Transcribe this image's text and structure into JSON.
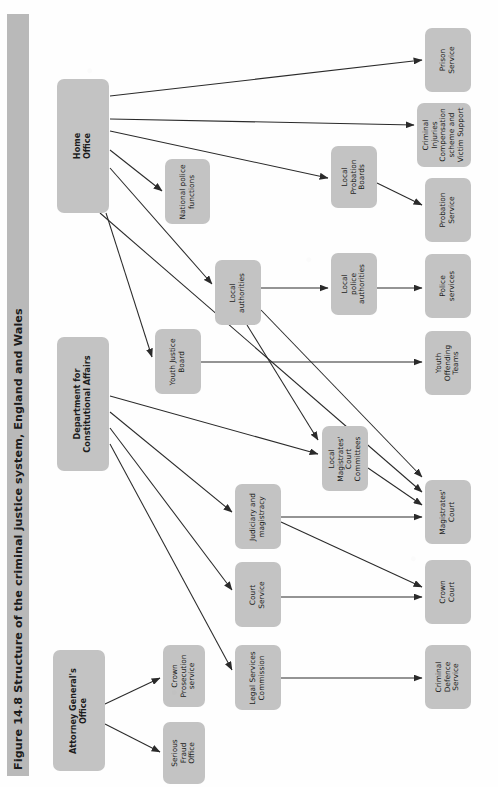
{
  "figure": {
    "title": "Figure 14.8 Structure of the criminal justice system, England and Wales",
    "orientation": "rotated-90-ccw",
    "box_fill": "#c3c3c3",
    "title_bar_fill": "#b9b9b9",
    "arrow_color": "#2a2a2a",
    "page_background": "#fefefe"
  },
  "nodes": [
    {
      "id": "home-office",
      "label": "Home\nOffice",
      "bold": true,
      "x": 57,
      "y": 79,
      "w": 52,
      "h": 134
    },
    {
      "id": "dept-constitutional",
      "label": "Department for\nConstitutional Affairs",
      "bold": true,
      "x": 57,
      "y": 337,
      "w": 52,
      "h": 134
    },
    {
      "id": "attorney-general",
      "label": "Attorney General's\nOffice",
      "bold": true,
      "x": 53,
      "y": 650,
      "w": 52,
      "h": 121
    },
    {
      "id": "national-police",
      "label": "National police\nfunctions",
      "bold": false,
      "x": 165,
      "y": 159,
      "w": 45,
      "h": 65
    },
    {
      "id": "local-authorities",
      "label": "Local\nauthorities",
      "bold": false,
      "x": 215,
      "y": 260,
      "w": 46,
      "h": 65
    },
    {
      "id": "youth-justice-board",
      "label": "Youth Justice\nBoard",
      "bold": false,
      "x": 155,
      "y": 329,
      "w": 46,
      "h": 65
    },
    {
      "id": "local-mag-committees",
      "label": "Local\nMagistrates'\nCourt\nCommittees",
      "bold": false,
      "x": 322,
      "y": 426,
      "w": 46,
      "h": 65
    },
    {
      "id": "judiciary-magistracy",
      "label": "Judiciary and\nmagistracy",
      "bold": false,
      "x": 235,
      "y": 484,
      "w": 46,
      "h": 65
    },
    {
      "id": "court-service",
      "label": "Court\nService",
      "bold": false,
      "x": 235,
      "y": 562,
      "w": 46,
      "h": 65
    },
    {
      "id": "legal-services-comm",
      "label": "Legal Services\nCommission",
      "bold": false,
      "x": 235,
      "y": 645,
      "w": 46,
      "h": 65
    },
    {
      "id": "crown-prosecution",
      "label": "Crown\nProsecution\nservice",
      "bold": false,
      "x": 163,
      "y": 645,
      "w": 42,
      "h": 62
    },
    {
      "id": "serious-fraud",
      "label": "Serious\nFraud\nOffice",
      "bold": false,
      "x": 163,
      "y": 722,
      "w": 42,
      "h": 62
    },
    {
      "id": "local-probation-boards",
      "label": "Local\nProbation\nBoards",
      "bold": false,
      "x": 331,
      "y": 146,
      "w": 46,
      "h": 62
    },
    {
      "id": "local-police-auth",
      "label": "Local\npolice\nauthorities",
      "bold": false,
      "x": 331,
      "y": 253,
      "w": 46,
      "h": 62
    },
    {
      "id": "prison-service",
      "label": "Prison\nService",
      "bold": false,
      "x": 425,
      "y": 28,
      "w": 46,
      "h": 64
    },
    {
      "id": "criminal-injuries",
      "label": "Criminal\nInjuries\nCompensation\nscheme and\nVictim Support",
      "bold": false,
      "x": 417,
      "y": 103,
      "w": 54,
      "h": 64
    },
    {
      "id": "probation-service",
      "label": "Probation\nService",
      "bold": false,
      "x": 425,
      "y": 178,
      "w": 46,
      "h": 64
    },
    {
      "id": "police-services",
      "label": "Police\nservices",
      "bold": false,
      "x": 425,
      "y": 254,
      "w": 46,
      "h": 64
    },
    {
      "id": "youth-offending-teams",
      "label": "Youth\nOffending\nTeams",
      "bold": false,
      "x": 425,
      "y": 331,
      "w": 46,
      "h": 64
    },
    {
      "id": "magistrates-court",
      "label": "Magistrates'\nCourt",
      "bold": false,
      "x": 425,
      "y": 480,
      "w": 46,
      "h": 64
    },
    {
      "id": "crown-court",
      "label": "Crown\nCourt",
      "bold": false,
      "x": 425,
      "y": 560,
      "w": 46,
      "h": 64
    },
    {
      "id": "criminal-defence",
      "label": "Criminal\nDefence\nService",
      "bold": false,
      "x": 425,
      "y": 645,
      "w": 46,
      "h": 64
    }
  ],
  "edges": [
    {
      "from": "home-office",
      "to": "prison-service",
      "x1": 110,
      "y1": 96,
      "x2": 422,
      "y2": 60
    },
    {
      "from": "home-office",
      "to": "criminal-injuries",
      "x1": 110,
      "y1": 119,
      "x2": 414,
      "y2": 125
    },
    {
      "from": "home-office",
      "to": "local-probation-boards",
      "x1": 110,
      "y1": 131,
      "x2": 328,
      "y2": 178
    },
    {
      "from": "home-office",
      "to": "national-police",
      "x1": 110,
      "y1": 150,
      "x2": 162,
      "y2": 191
    },
    {
      "from": "home-office",
      "to": "local-authorities",
      "x1": 110,
      "y1": 168,
      "x2": 212,
      "y2": 284
    },
    {
      "from": "home-office",
      "to": "youth-justice-board",
      "x1": 106,
      "y1": 213,
      "x2": 152,
      "y2": 357
    },
    {
      "from": "home-office",
      "to": "magistrates-court",
      "x1": 100,
      "y1": 213,
      "x2": 422,
      "y2": 492
    },
    {
      "from": "local-probation-boards",
      "to": "probation-service",
      "x1": 377,
      "y1": 183,
      "x2": 422,
      "y2": 205
    },
    {
      "from": "local-authorities",
      "to": "local-police-auth",
      "x1": 261,
      "y1": 288,
      "x2": 328,
      "y2": 288
    },
    {
      "from": "local-police-auth",
      "to": "police-services",
      "x1": 377,
      "y1": 288,
      "x2": 422,
      "y2": 288
    },
    {
      "from": "local-authorities",
      "to": "local-mag-committees",
      "x1": 247,
      "y1": 325,
      "x2": 318,
      "y2": 440
    },
    {
      "from": "local-authorities",
      "to": "magistrates-court",
      "x1": 261,
      "y1": 310,
      "x2": 422,
      "y2": 477
    },
    {
      "from": "youth-justice-board",
      "to": "youth-offending-teams",
      "x1": 201,
      "y1": 362,
      "x2": 422,
      "y2": 362
    },
    {
      "from": "dept-constitutional",
      "to": "local-mag-committees",
      "x1": 110,
      "y1": 396,
      "x2": 318,
      "y2": 454
    },
    {
      "from": "dept-constitutional",
      "to": "judiciary-magistracy",
      "x1": 110,
      "y1": 412,
      "x2": 232,
      "y2": 512
    },
    {
      "from": "dept-constitutional",
      "to": "court-service",
      "x1": 110,
      "y1": 428,
      "x2": 232,
      "y2": 590
    },
    {
      "from": "dept-constitutional",
      "to": "legal-services-comm",
      "x1": 110,
      "y1": 444,
      "x2": 232,
      "y2": 670
    },
    {
      "from": "judiciary-magistracy",
      "to": "magistrates-court",
      "x1": 281,
      "y1": 517,
      "x2": 422,
      "y2": 517
    },
    {
      "from": "judiciary-magistracy",
      "to": "crown-court",
      "x1": 281,
      "y1": 522,
      "x2": 422,
      "y2": 587
    },
    {
      "from": "local-mag-committees",
      "to": "magistrates-court",
      "x1": 368,
      "y1": 468,
      "x2": 422,
      "y2": 505
    },
    {
      "from": "court-service",
      "to": "crown-court",
      "x1": 281,
      "y1": 597,
      "x2": 422,
      "y2": 597
    },
    {
      "from": "legal-services-comm",
      "to": "criminal-defence",
      "x1": 281,
      "y1": 678,
      "x2": 422,
      "y2": 678
    },
    {
      "from": "attorney-general",
      "to": "crown-prosecution",
      "x1": 105,
      "y1": 704,
      "x2": 160,
      "y2": 678
    },
    {
      "from": "attorney-general",
      "to": "serious-fraud",
      "x1": 105,
      "y1": 724,
      "x2": 160,
      "y2": 752
    }
  ]
}
